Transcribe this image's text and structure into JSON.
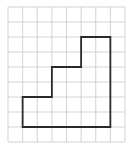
{
  "label": ")",
  "grid": {
    "origin_x": 8,
    "origin_y": 7,
    "cell_w": 14.625,
    "cell_h": 15,
    "cols": 8,
    "rows": 9,
    "line_color": "#c8c8c8"
  },
  "shape": {
    "stroke_color": "#2a2a2a",
    "stroke_width": 1.8,
    "vertices": [
      [
        1,
        6
      ],
      [
        3,
        6
      ],
      [
        3,
        4
      ],
      [
        5,
        4
      ],
      [
        5,
        2
      ],
      [
        7,
        2
      ],
      [
        7,
        8
      ],
      [
        1,
        8
      ]
    ]
  }
}
